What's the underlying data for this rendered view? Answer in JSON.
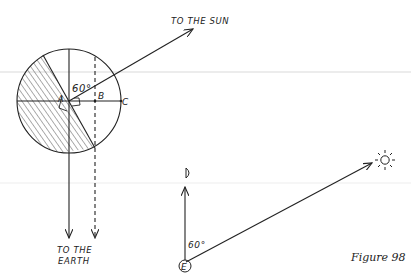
{
  "figure": {
    "caption": "Figure 98"
  },
  "moon_diagram": {
    "center_label": "A",
    "point_b_label": "B",
    "point_c_label": "C",
    "angle_label": "60°",
    "sun_direction_label": "TO THE SUN",
    "earth_direction_label_line1": "TO THE",
    "earth_direction_label_line2": "EARTH"
  },
  "sky_diagram": {
    "earth_label": "E",
    "moon_symbol": "moon-crescent",
    "sun_symbol": "sun",
    "angle_label": "60°"
  },
  "colors": {
    "ink": "#222222",
    "background": "#ffffff",
    "scan_line": "#e6e6e6"
  }
}
